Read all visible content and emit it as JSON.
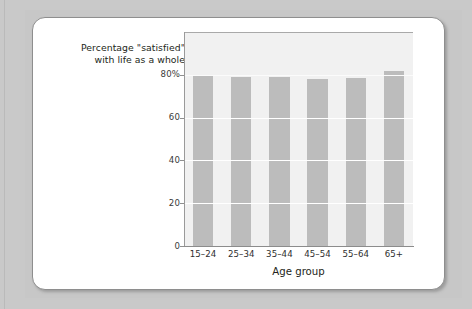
{
  "figure": {
    "title_line1": "Percentage \"satisfied\"",
    "title_line2": "with life as a whole",
    "xaxis_title": "Age group"
  },
  "colors": {
    "bar": "#bcbcbc",
    "plot_background": "#f1f1f1",
    "gridline": "#ffffff",
    "axis": "#8f8f8f",
    "text": "#231f20",
    "card_background": "#ffffff",
    "card_border": "#8e8e8e",
    "page_background": "#c9c9c9"
  },
  "chart_data": {
    "type": "bar",
    "title": "Percentage \"satisfied\" with life as a whole",
    "xlabel": "Age group",
    "ylabel": "",
    "categories": [
      "15–24",
      "25–34",
      "35–44",
      "45–54",
      "55–64",
      "65+"
    ],
    "values": [
      80,
      79,
      79,
      78,
      78.5,
      82
    ],
    "ylim": [
      0,
      100
    ],
    "yticks": [
      0,
      20,
      40,
      60,
      80
    ],
    "ytick_labels": [
      "0",
      "20",
      "40",
      "60",
      "80%"
    ],
    "grid": true,
    "legend": false
  }
}
